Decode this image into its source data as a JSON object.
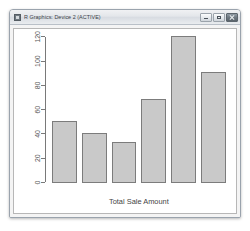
{
  "window": {
    "title": "R Graphics: Device 2 (ACTIVE)",
    "app_icon": "r-graphics-icon",
    "controls": {
      "minimize_label": "Minimize",
      "maximize_label": "Maximize",
      "close_label": "Close"
    }
  },
  "chart_data": {
    "type": "bar",
    "title": "",
    "subtitle": "",
    "xlabel": "Total Sale Amount",
    "ylabel": "",
    "categories": [
      "1",
      "2",
      "3",
      "4",
      "5",
      "6"
    ],
    "values": [
      50,
      40,
      33,
      68,
      120,
      91
    ],
    "ylim": [
      0,
      120
    ],
    "yticks": [
      0,
      20,
      40,
      60,
      80,
      100,
      120
    ],
    "ytick_labels": [
      "0",
      "20",
      "40",
      "60",
      "80",
      "100",
      "120"
    ],
    "ytick_label_rotation": 90,
    "grid": false,
    "legend": null,
    "bar_fill": "#c9c9c9",
    "bar_stroke": "#7a7a7a",
    "axis_color": "#777777",
    "plot_background": "#ffffff"
  }
}
